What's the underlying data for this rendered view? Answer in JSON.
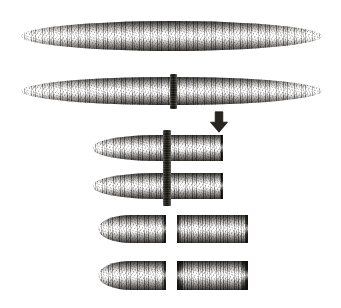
{
  "figure": {
    "background_color": "#ffffff",
    "width": 341,
    "height": 308,
    "medium": "grayscale engraving / pencil illustration",
    "ink_color": "#1a1917",
    "body_mid_tone": "#7b7772"
  },
  "stages": [
    {
      "id": "stage-1-intact-worm",
      "label": "Intact worm",
      "row": 1,
      "specimens": [
        {
          "id": "worm-intact",
          "name": "intact-worm",
          "x": 21,
          "y": 21,
          "width": 301,
          "height": 30,
          "left_end": "rounded",
          "right_end": "rounded",
          "cut_bar": null
        }
      ]
    },
    {
      "id": "stage-2-worm-with-cut-marker",
      "label": "Worm marked for transverse section",
      "row": 2,
      "specimens": [
        {
          "id": "worm-marked",
          "name": "marked-worm",
          "x": 21,
          "y": 77,
          "width": 301,
          "height": 28,
          "left_end": "rounded",
          "right_end": "rounded",
          "cut_bar": {
            "x": 170,
            "y": 74,
            "width": 7,
            "height": 35
          }
        }
      ]
    },
    {
      "id": "stage-3-sectioned-fragments-in-place",
      "label": "Fragments still aligned at the plane of section",
      "row": 3,
      "cut_bar": {
        "x": 163,
        "y": 130,
        "width": 8,
        "height": 76
      },
      "specimens": [
        {
          "id": "fragment-upper-aligned",
          "name": "aligned-fragment-upper",
          "x": 92,
          "y": 135,
          "width": 131,
          "height": 26,
          "left_end": "rounded",
          "right_end": "cut"
        },
        {
          "id": "fragment-lower-aligned",
          "name": "aligned-fragment-lower",
          "x": 92,
          "y": 173,
          "width": 131,
          "height": 26,
          "left_end": "rounded",
          "right_end": "cut"
        }
      ]
    },
    {
      "id": "stage-4-separated-fragments",
      "label": "Anterior and posterior fragments separated",
      "row": 4,
      "specimens": [
        {
          "id": "fragment-anterior-upper",
          "name": "anterior-fragment-upper",
          "x": 98,
          "y": 215,
          "width": 68,
          "height": 28,
          "left_end": "rounded",
          "right_end": "cut"
        },
        {
          "id": "fragment-posterior-upper",
          "name": "posterior-fragment-upper",
          "x": 177,
          "y": 215,
          "width": 71,
          "height": 28,
          "left_end": "cut",
          "right_end": "cut"
        },
        {
          "id": "fragment-anterior-lower",
          "name": "anterior-fragment-lower",
          "x": 98,
          "y": 261,
          "width": 68,
          "height": 29,
          "left_end": "rounded",
          "right_end": "cut"
        },
        {
          "id": "fragment-posterior-lower",
          "name": "posterior-fragment-lower",
          "x": 177,
          "y": 261,
          "width": 71,
          "height": 29,
          "left_end": "cut",
          "right_end": "cut",
          "shape": "flared"
        }
      ]
    }
  ],
  "arrow": {
    "id": "process-arrow",
    "name": "down-arrow",
    "direction": "down",
    "x": 209,
    "y": 111,
    "width": 20,
    "height": 22,
    "color": "#27251f"
  }
}
